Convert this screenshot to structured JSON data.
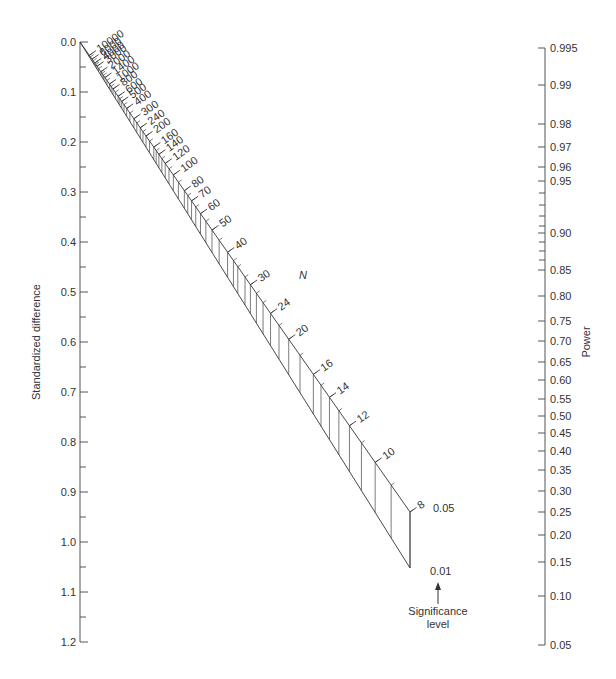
{
  "chart_data": {
    "type": "nomogram",
    "title": "",
    "left_axis": {
      "label": "Standardized difference",
      "ticks": [
        "0.0",
        "0.1",
        "0.2",
        "0.3",
        "0.4",
        "0.5",
        "0.6",
        "0.7",
        "0.8",
        "0.9",
        "1.0",
        "1.1",
        "1.2"
      ],
      "values": [
        0.0,
        0.1,
        0.2,
        0.3,
        0.4,
        0.5,
        0.6,
        0.7,
        0.8,
        0.9,
        1.0,
        1.1,
        1.2
      ],
      "range": [
        0.0,
        1.2
      ],
      "minor_ticks": "every 0.05"
    },
    "right_axis": {
      "label": "Power",
      "ticks": [
        "0.995",
        "0.99",
        "0.98",
        "0.97",
        "0.96",
        "0.95",
        "0.90",
        "0.85",
        "0.80",
        "0.75",
        "0.70",
        "0.65",
        "0.60",
        "0.55",
        "0.50",
        "0.45",
        "0.40",
        "0.35",
        "0.30",
        "0.25",
        "0.20",
        "0.15",
        "0.10",
        "0.05"
      ],
      "pixel_y": [
        48,
        85,
        124,
        147,
        167,
        181,
        233,
        270,
        296,
        321,
        341,
        362,
        380,
        399,
        416,
        433,
        451,
        470,
        491,
        512,
        535,
        562,
        596,
        645
      ]
    },
    "n_scale": {
      "label": "N",
      "ticks": [
        "10000",
        "6000",
        "4000",
        "3000",
        "2000",
        "1400",
        "1000",
        "800",
        "600",
        "500",
        "400",
        "300",
        "240",
        "200",
        "160",
        "140",
        "120",
        "100",
        "80",
        "70",
        "60",
        "50",
        "40",
        "30",
        "24",
        "20",
        "16",
        "14",
        "12",
        "10",
        "8"
      ],
      "values": [
        10000,
        6000,
        4000,
        3000,
        2000,
        1400,
        1000,
        800,
        600,
        500,
        400,
        300,
        240,
        200,
        160,
        140,
        120,
        100,
        80,
        70,
        60,
        50,
        40,
        30,
        24,
        20,
        16,
        14,
        12,
        10,
        8
      ]
    },
    "significance": {
      "label_line1": "Significance",
      "label_line2": "level",
      "levels": [
        "0.05",
        "0.01"
      ]
    }
  }
}
